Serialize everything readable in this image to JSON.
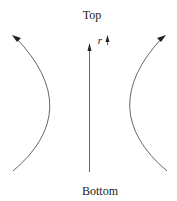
{
  "diagram": {
    "top_label": "Top",
    "bottom_label": "Bottom",
    "axis_label": "r",
    "elements": [
      {
        "id": "left-flow-arc",
        "description": "curved arrow on left bowing inward, pointing upward-left"
      },
      {
        "id": "center-axis-arrow",
        "description": "straight vertical arrow pointing up"
      },
      {
        "id": "right-flow-arc",
        "description": "curved arrow on right bowing inward, pointing upward-right"
      },
      {
        "id": "r-direction-arrow",
        "description": "small up arrow next to r label"
      }
    ],
    "colors": {
      "line": "#555555",
      "text": "#222222",
      "background": "#ffffff"
    }
  }
}
